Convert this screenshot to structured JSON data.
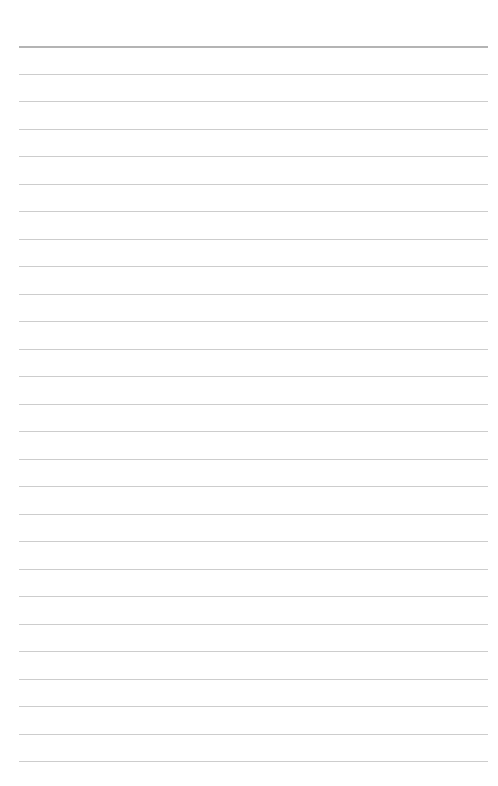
{
  "page": {
    "type": "lined-paper",
    "background": "#ffffff",
    "lines": {
      "count": 27,
      "first_y": 46,
      "last_y": 761,
      "spacing": 27.5,
      "left_x": 19,
      "right_x": 488,
      "top_rule_color": "#b4b4b4",
      "rule_color": "#cdcdcd"
    },
    "text": []
  }
}
